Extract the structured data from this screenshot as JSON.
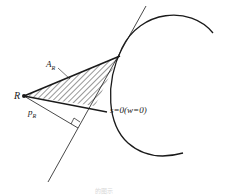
{
  "diagram": {
    "labels": {
      "point": "R",
      "area_main": "A",
      "area_sub": "R",
      "distance_main": "p",
      "distance_sub": "R",
      "curve_condition": "s=0(w=0)"
    },
    "caption": "的图示",
    "colors": {
      "stroke": "#1a1a1a",
      "background": "#ffffff",
      "caption": "#d8d8d8"
    }
  }
}
